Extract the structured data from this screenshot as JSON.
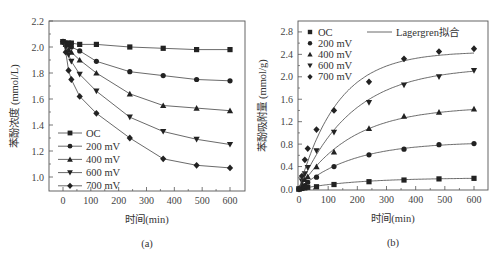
{
  "chart_data": [
    {
      "id": "a",
      "type": "line",
      "caption": "(a)",
      "title": "",
      "xlabel": "时间(min)",
      "ylabel": "苯酚浓度 (mmol/L)",
      "xlim": [
        -20,
        650
      ],
      "ylim": [
        0.9,
        2.2
      ],
      "xticks": [
        0,
        100,
        200,
        300,
        400,
        500,
        600
      ],
      "yticks": [
        1.0,
        1.2,
        1.4,
        1.6,
        1.8,
        2.0,
        2.2
      ],
      "grid": false,
      "legend_position": "lower left",
      "x": [
        0,
        10,
        20,
        30,
        60,
        120,
        240,
        360,
        480,
        600
      ],
      "series": [
        {
          "name": "OC",
          "marker": "square",
          "values": [
            2.04,
            2.03,
            2.03,
            2.03,
            2.02,
            2.02,
            2.0,
            1.99,
            1.98,
            1.98
          ]
        },
        {
          "name": "200 mV",
          "marker": "circle",
          "values": [
            2.04,
            2.03,
            2.02,
            2.0,
            1.97,
            1.89,
            1.81,
            1.78,
            1.75,
            1.74
          ]
        },
        {
          "name": "400 mV",
          "marker": "triangle-up",
          "values": [
            2.04,
            2.02,
            1.98,
            1.96,
            1.9,
            1.8,
            1.64,
            1.55,
            1.53,
            1.51
          ]
        },
        {
          "name": "600 mV",
          "marker": "triangle-down",
          "values": [
            2.04,
            2.0,
            1.94,
            1.89,
            1.79,
            1.66,
            1.46,
            1.35,
            1.29,
            1.25
          ]
        },
        {
          "name": "700 mV",
          "marker": "diamond",
          "values": [
            2.04,
            1.96,
            1.82,
            1.75,
            1.62,
            1.49,
            1.3,
            1.14,
            1.09,
            1.07
          ]
        }
      ]
    },
    {
      "id": "b",
      "type": "scatter",
      "caption": "(b)",
      "title": "",
      "xlabel": "时间(min)",
      "ylabel": "苯酚吸附量 (mmol/g)",
      "xlim": [
        0,
        650
      ],
      "ylim": [
        0,
        3.0
      ],
      "xticks": [
        0,
        100,
        200,
        300,
        400,
        500,
        600
      ],
      "yticks": [
        0.0,
        0.4,
        0.8,
        1.2,
        1.6,
        2.0,
        2.4,
        2.8
      ],
      "grid": false,
      "legend_position": "upper left",
      "fit_label": "Lagergren拟合",
      "x": [
        0,
        10,
        20,
        30,
        60,
        120,
        240,
        360,
        480,
        600
      ],
      "series": [
        {
          "name": "OC",
          "marker": "square",
          "values": [
            0,
            0.01,
            0.02,
            0.03,
            0.04,
            0.08,
            0.13,
            0.16,
            0.18,
            0.19
          ],
          "qe": 0.2,
          "k": 0.005
        },
        {
          "name": "200 mV",
          "marker": "circle",
          "values": [
            0,
            0.03,
            0.06,
            0.12,
            0.21,
            0.4,
            0.61,
            0.71,
            0.79,
            0.81
          ],
          "qe": 0.84,
          "k": 0.0055
        },
        {
          "name": "400 mV",
          "marker": "triangle-up",
          "values": [
            0,
            0.08,
            0.17,
            0.22,
            0.4,
            0.66,
            1.08,
            1.3,
            1.37,
            1.43
          ],
          "qe": 1.47,
          "k": 0.0055
        },
        {
          "name": "600 mV",
          "marker": "triangle-down",
          "values": [
            0,
            0.14,
            0.27,
            0.38,
            0.68,
            1.01,
            1.54,
            1.85,
            2.0,
            2.11
          ],
          "qe": 2.18,
          "k": 0.0055
        },
        {
          "name": "700 mV",
          "marker": "diamond",
          "values": [
            0,
            0.23,
            0.52,
            0.72,
            1.06,
            1.4,
            1.91,
            2.32,
            2.45,
            2.5
          ],
          "qe": 2.45,
          "k": 0.0075
        }
      ]
    }
  ],
  "captions": {
    "a": "(a)",
    "b": "(b)"
  },
  "colors": {
    "line": "#444444",
    "marker": "#222222",
    "axis": "#555555"
  }
}
